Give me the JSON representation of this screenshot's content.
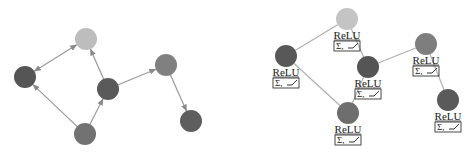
{
  "left_panel": {
    "type": "directed-graph",
    "node_radius": 11,
    "nodes": [
      {
        "id": "n_top",
        "cx": 86,
        "cy": 39,
        "color": "#bdbdbd"
      },
      {
        "id": "n_left",
        "cx": 25,
        "cy": 77,
        "color": "#555555"
      },
      {
        "id": "n_center",
        "cx": 108,
        "cy": 89,
        "color": "#5a5a5a"
      },
      {
        "id": "n_right_top",
        "cx": 166,
        "cy": 65,
        "color": "#808080"
      },
      {
        "id": "n_bottom",
        "cx": 85,
        "cy": 134,
        "color": "#727272"
      },
      {
        "id": "n_right_bottom",
        "cx": 191,
        "cy": 121,
        "color": "#5e5e5e"
      }
    ],
    "edges": [
      {
        "from": "n_left",
        "to": "n_top",
        "bidirectional": true
      },
      {
        "from": "n_center",
        "to": "n_top"
      },
      {
        "from": "n_bottom",
        "to": "n_left"
      },
      {
        "from": "n_bottom",
        "to": "n_center"
      },
      {
        "from": "n_center",
        "to": "n_right_top"
      },
      {
        "from": "n_right_top",
        "to": "n_right_bottom"
      }
    ],
    "edge_color": "#9a9a9a"
  },
  "right_panel": {
    "type": "undirected-graph",
    "node_radius": 11,
    "activation_label": "ReLU",
    "function_label": "Σ, ⌐",
    "nodes": [
      {
        "id": "m_top",
        "cx": 347,
        "cy": 19,
        "color": "#c4c4c4",
        "label": "ReLU",
        "fn": "Σ, ⌐"
      },
      {
        "id": "m_left",
        "cx": 286,
        "cy": 56,
        "color": "#585858",
        "label": "ReLU",
        "fn": "Σ, ⌐"
      },
      {
        "id": "m_center",
        "cx": 368,
        "cy": 67,
        "color": "#555555",
        "label": "ReLU",
        "fn": "Σ, ⌐"
      },
      {
        "id": "m_right_top",
        "cx": 426,
        "cy": 44,
        "color": "#7e7e7e",
        "label": "ReLU",
        "fn": "Σ, ⌐"
      },
      {
        "id": "m_bottom",
        "cx": 348,
        "cy": 113,
        "color": "#6e6e6e",
        "label": "ReLU",
        "fn": "Σ, ⌐"
      },
      {
        "id": "m_right_bottom",
        "cx": 448,
        "cy": 100,
        "color": "#5a5a5a",
        "label": "ReLU",
        "fn": "Σ, ⌐"
      }
    ],
    "edges": [
      {
        "from": "m_left",
        "to": "m_top"
      },
      {
        "from": "m_top",
        "to": "m_center"
      },
      {
        "from": "m_left",
        "to": "m_bottom"
      },
      {
        "from": "m_bottom",
        "to": "m_center"
      },
      {
        "from": "m_center",
        "to": "m_right_top"
      },
      {
        "from": "m_right_top",
        "to": "m_right_bottom"
      }
    ],
    "edge_color": "#b0b0b0"
  }
}
